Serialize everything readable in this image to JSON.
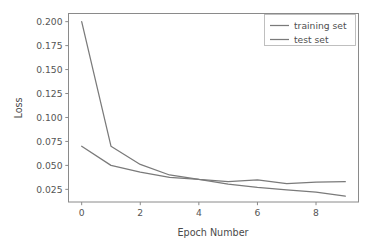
{
  "chart_data": {
    "type": "line",
    "title": "",
    "xlabel": "Epoch Number",
    "ylabel": "Loss",
    "x": [
      0,
      1,
      2,
      3,
      4,
      5,
      6,
      7,
      8,
      9
    ],
    "series": [
      {
        "name": "training set",
        "color": "#7a7a7a",
        "values": [
          0.07,
          0.05,
          0.043,
          0.0375,
          0.0355,
          0.0305,
          0.027,
          0.0245,
          0.022,
          0.018
        ]
      },
      {
        "name": "test set",
        "color": "#7a7a7a",
        "values": [
          0.2,
          0.07,
          0.051,
          0.04,
          0.0355,
          0.033,
          0.035,
          0.031,
          0.0325,
          0.033
        ]
      }
    ],
    "xticks": [
      0,
      2,
      4,
      6,
      8
    ],
    "xtick_labels": [
      "0",
      "2",
      "4",
      "6",
      "8"
    ],
    "yticks": [
      0.025,
      0.05,
      0.075,
      0.1,
      0.125,
      0.15,
      0.175,
      0.2
    ],
    "ytick_labels": [
      "0.025",
      "0.050",
      "0.075",
      "0.100",
      "0.125",
      "0.150",
      "0.175",
      "0.200"
    ],
    "xlim": [
      -0.45,
      9.45
    ],
    "ylim": [
      0.0118,
      0.2085
    ],
    "grid": false,
    "legend_position": "upper right",
    "legend_entries": [
      "training set",
      "test set"
    ],
    "frame_color": "#8a8a8a",
    "background": "#ffffff"
  }
}
